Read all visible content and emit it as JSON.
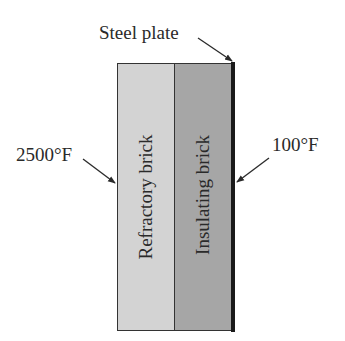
{
  "diagram": {
    "type": "composite-wall-cross-section",
    "layers": [
      {
        "label": "Refractory brick",
        "color": "#d3d3d3"
      },
      {
        "label": "Insulating brick",
        "color": "#a6a6a6"
      },
      {
        "label": "Steel plate",
        "color": "#1a1a1a"
      }
    ],
    "callouts": {
      "steel_plate": "Steel plate",
      "hot_side_temperature": "2500°F",
      "cold_side_temperature": "100°F"
    }
  }
}
